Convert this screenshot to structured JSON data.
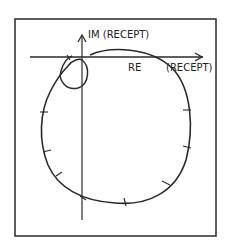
{
  "diagram": {
    "type": "polar-plot",
    "axes": {
      "imaginary_label": "IM (RECEPT)",
      "real_label": "RE",
      "real_unit_label": "(RECEPT)"
    },
    "colors": {
      "stroke": "#2a2a2a",
      "background": "#ffffff"
    },
    "curves": [
      {
        "name": "large-locus",
        "description": "large near-circular admittance locus with tick marks"
      },
      {
        "name": "small-loop",
        "description": "small circular loop near origin"
      }
    ],
    "tick_count": 9
  }
}
